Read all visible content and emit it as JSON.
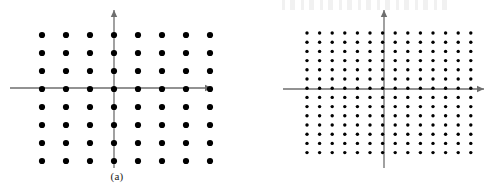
{
  "figure": {
    "width": 494,
    "height": 194,
    "background_color": "#ffffff",
    "dot_color": "#000000",
    "axis_color": "#6e6e6e"
  },
  "panels": [
    {
      "id": "panel-a",
      "caption": "(a)",
      "axis_origin": {
        "x": 114,
        "y": 88
      },
      "x_axis": {
        "start_x": 10,
        "end_x": 212,
        "y": 88,
        "arrow": "right"
      },
      "y_axis": {
        "x": 114,
        "start_y": 168,
        "end_y": 10,
        "arrow": "up"
      },
      "lattice": {
        "type": "square",
        "columns": 8,
        "rows": 8,
        "total_points": 64,
        "spacing_x": 24,
        "spacing_y": 18,
        "dot_radius": 3.1,
        "first_x": 42,
        "first_y": 35
      }
    },
    {
      "id": "panel-b",
      "caption": "(b)",
      "axis_origin": {
        "x": 384,
        "y": 89
      },
      "x_axis": {
        "start_x": 283,
        "end_x": 484,
        "y": 89,
        "arrow": "right"
      },
      "y_axis": {
        "x": 384,
        "start_y": 168,
        "end_y": 10,
        "arrow": "up"
      },
      "lattice": {
        "type": "square",
        "columns": 14,
        "rows": 14,
        "total_points": 196,
        "spacing_x": 12.6,
        "spacing_y": 9.2,
        "dot_radius": 1.7,
        "first_x": 307,
        "first_y": 33
      }
    }
  ],
  "chart_data": {
    "type": "scatter",
    "title": "",
    "xlabel": "",
    "ylabel": "",
    "grid": false,
    "legend": "none",
    "series": [
      {
        "name": "(a)",
        "lattice": "square",
        "columns": 8,
        "rows": 8,
        "count": 64,
        "x": [
          -4,
          -3,
          -2,
          -1,
          1,
          2,
          3,
          4
        ],
        "y": [
          4,
          3,
          2,
          1,
          -1,
          -2,
          -3,
          -4
        ]
      },
      {
        "name": "(b)",
        "lattice": "square",
        "columns": 14,
        "rows": 14,
        "count": 196,
        "x": [
          -7,
          -6,
          -5,
          -4,
          -3,
          -2,
          -1,
          1,
          2,
          3,
          4,
          5,
          6,
          7
        ],
        "y": [
          7,
          6,
          5,
          4,
          3,
          2,
          1,
          -1,
          -2,
          -3,
          -4,
          -5,
          -6,
          -7
        ]
      }
    ]
  }
}
